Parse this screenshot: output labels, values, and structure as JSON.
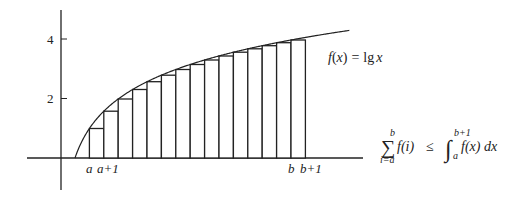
{
  "figure": {
    "function_label": "f(x) = lg x",
    "function_label_parts": {
      "f": "f",
      "lpar": "(",
      "x": "x",
      "rpar": ")",
      "eq": "=",
      "lg": "lg",
      "x2": "x"
    },
    "y_ticks": [
      {
        "label": "4",
        "value": 4
      },
      {
        "label": "2",
        "value": 2
      }
    ],
    "x_labels": [
      {
        "label": "a",
        "index": 2
      },
      {
        "label": "a+1",
        "index": 3
      },
      {
        "label": "b",
        "index": 16
      },
      {
        "label": "b+1",
        "index": 17
      }
    ],
    "inequality": {
      "sum_upper": "b",
      "sum_lower": "i=a",
      "sum_symbol": "∑",
      "summand": "f(i)",
      "relation": "≤",
      "integral_symbol": "∫",
      "int_upper": "b+1",
      "int_lower": "a",
      "integrand": "f(x) dx"
    },
    "bars": {
      "from_index": 2,
      "to_index": 16,
      "heights": [
        1.0,
        1.585,
        2.0,
        2.322,
        2.585,
        2.807,
        3.0,
        3.17,
        3.322,
        3.459,
        3.585,
        3.7,
        3.807,
        3.907,
        4.0
      ]
    },
    "colors": {
      "ink": "#222222",
      "background": "#ffffff"
    }
  }
}
